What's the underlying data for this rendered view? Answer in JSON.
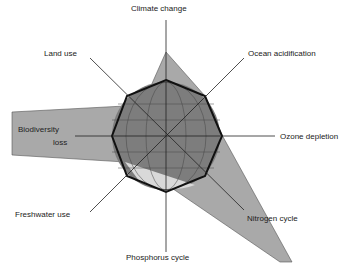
{
  "diagram": {
    "center": [
      166,
      136
    ],
    "safe_zone_radius": 56,
    "colors": {
      "exceeded_fill": "#a9a9a9",
      "globe_fill": "#7d7d7d",
      "globe_light": "#d9d9d9",
      "axis": "#222222",
      "octagon": "#111111"
    },
    "labels": [
      {
        "id": "climate",
        "text": "Climate change",
        "x": 131,
        "y": 10
      },
      {
        "id": "ocean",
        "text": "Ocean acidification",
        "x": 248,
        "y": 49
      },
      {
        "id": "ozone",
        "text": "Ozone depletion",
        "x": 280,
        "y": 132
      },
      {
        "id": "nitrogen",
        "text": "Nitrogen cycle",
        "x": 247,
        "y": 214
      },
      {
        "id": "phosphorus",
        "text": "Phosphorus cycle",
        "x": 126,
        "y": 253
      },
      {
        "id": "freshwater",
        "text": "Freshwater use",
        "x": 15,
        "y": 210
      },
      {
        "id": "biodiversity",
        "text": "Biodiversity",
        "x": 18,
        "y": 125
      },
      {
        "id": "biodiversity2",
        "text": "loss",
        "x": 53,
        "y": 138
      },
      {
        "id": "land",
        "text": "Land use",
        "x": 44,
        "y": 49
      }
    ]
  }
}
